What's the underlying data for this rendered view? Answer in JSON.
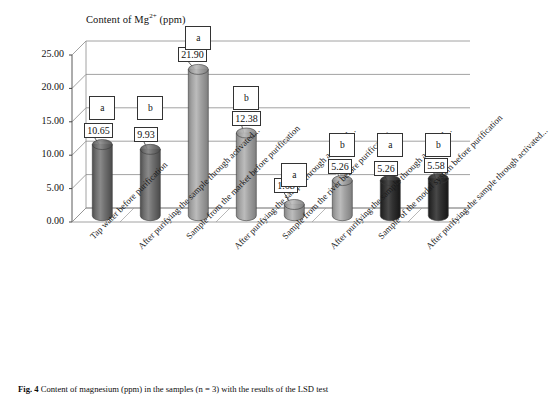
{
  "chart_data": {
    "type": "bar",
    "title": "Content of Mg2+ (ppm)",
    "title_prefix": "Content of Mg",
    "title_sup": "2+",
    "title_suffix": " (ppm)",
    "xlabel": "",
    "ylabel": "",
    "ylim": [
      0,
      25
    ],
    "ytick_labels": [
      "0.00",
      "5.00",
      "10.00",
      "15.00",
      "20.00",
      "25.00"
    ],
    "ytick_values": [
      0,
      5,
      10,
      15,
      20,
      25
    ],
    "grid": true,
    "legend": "none",
    "three_d": true,
    "categories": [
      "Tap water before purification",
      "After purifying the sample through activated...",
      "Sample from the market before purification",
      "After purifying the sample through activated...",
      "Sample from the river before purification",
      "After purifying the sample through activated...",
      "Sample of the modal system before purification",
      "After purifying the sample through activated..."
    ],
    "values": [
      10.65,
      9.93,
      21.9,
      12.38,
      1.68,
      5.26,
      5.26,
      5.58
    ],
    "value_labels": [
      "10.65",
      "9.93",
      "21.90",
      "12.38",
      "1.68",
      "5.26",
      "5.26",
      "5.58"
    ],
    "significance_letters": [
      "a",
      "b",
      "a",
      "b",
      "a",
      "b",
      "a",
      "b"
    ],
    "bar_colors": [
      "#6b6b6b",
      "#6b6b6b",
      "#9d9d9d",
      "#8d8d8d",
      "#9a9a9a",
      "#9a9a9a",
      "#2c2c2c",
      "#2c2c2c"
    ]
  },
  "caption": {
    "label": "Fig. 4",
    "text": "Content of magnesium (ppm) in the samples (n = 3) with the results of the LSD test"
  }
}
